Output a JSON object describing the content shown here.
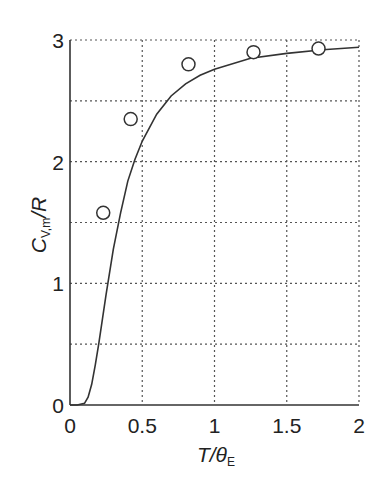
{
  "chart_data": {
    "type": "line",
    "title": "",
    "xlabel": "T/θE",
    "xlabel_main": "T/θ",
    "xlabel_sub": "E",
    "ylabel": "C_V,m/R",
    "ylabel_main": "C",
    "ylabel_sub": "V,m",
    "ylabel_tail": "/R",
    "xlim": [
      0,
      2
    ],
    "ylim": [
      0,
      3
    ],
    "xticks": [
      0,
      0.5,
      1,
      1.5,
      2
    ],
    "xtick_labels": [
      "0",
      "0.5",
      "1",
      "1.5",
      "2"
    ],
    "yticks": [
      0,
      1,
      2,
      3
    ],
    "ytick_labels": [
      "0",
      "1",
      "2",
      "3"
    ],
    "y_minor_grid": [
      0.5,
      1.5,
      2.5
    ],
    "grid": true,
    "legend": null,
    "series": [
      {
        "name": "Einstein model",
        "style": "line",
        "x": [
          0,
          0.05,
          0.1,
          0.125,
          0.15,
          0.175,
          0.2,
          0.225,
          0.25,
          0.3,
          0.35,
          0.4,
          0.45,
          0.5,
          0.6,
          0.7,
          0.8,
          0.9,
          1.0,
          1.25,
          1.5,
          1.75,
          2.0
        ],
        "y": [
          0,
          0,
          0.014,
          0.064,
          0.17,
          0.33,
          0.51,
          0.71,
          0.91,
          1.28,
          1.58,
          1.84,
          2.02,
          2.17,
          2.39,
          2.54,
          2.64,
          2.71,
          2.76,
          2.85,
          2.89,
          2.92,
          2.94
        ]
      },
      {
        "name": "Experimental data",
        "style": "open-circle",
        "x": [
          0.23,
          0.42,
          0.82,
          1.27,
          1.72
        ],
        "y": [
          1.58,
          2.35,
          2.8,
          2.9,
          2.93
        ]
      }
    ]
  }
}
